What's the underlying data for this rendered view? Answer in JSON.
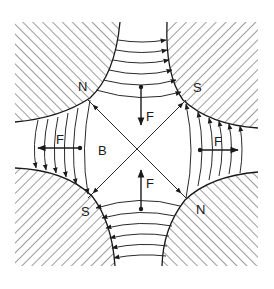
{
  "diagram": {
    "type": "quadrupole-magnet-cross-section",
    "colors": {
      "ink": "#1a1a1a",
      "background": "#ffffff"
    },
    "poles": [
      {
        "id": "top-left",
        "label": "N"
      },
      {
        "id": "top-right",
        "label": "S"
      },
      {
        "id": "bottom-left",
        "label": "S"
      },
      {
        "id": "bottom-right",
        "label": "N"
      }
    ],
    "field_label": "B",
    "forces": [
      {
        "id": "top",
        "label": "F",
        "direction": "down"
      },
      {
        "id": "bottom",
        "label": "F",
        "direction": "up"
      },
      {
        "id": "left",
        "label": "F",
        "direction": "left"
      },
      {
        "id": "right",
        "label": "F",
        "direction": "right"
      }
    ]
  }
}
